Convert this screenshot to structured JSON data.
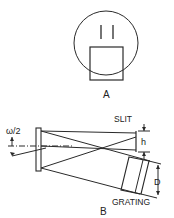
{
  "figure": {
    "panel_a": {
      "label": "A"
    },
    "panel_b": {
      "label": "B",
      "slit_label": "SLIT",
      "slit_height_label": "h",
      "grating_label": "GRATING",
      "grating_width_label": "D",
      "angle_label": "ω/2"
    }
  },
  "colors": {
    "stroke": "#2a2a2a",
    "background": "#ffffff"
  }
}
